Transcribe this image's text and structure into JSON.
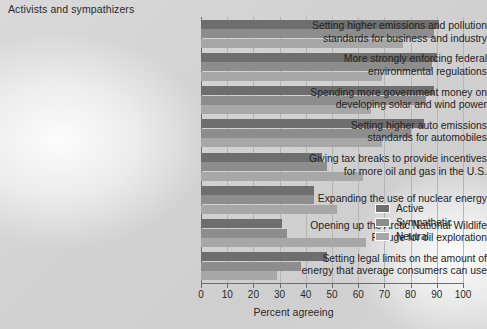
{
  "chart_title": "Activists and sympathizers",
  "xlabel": "Percent agreeing",
  "legend": {
    "items": [
      {
        "label": "Active",
        "color": "#6e6e6e"
      },
      {
        "label": "Sympathetic",
        "color": "#8d8d8d"
      },
      {
        "label": "Neutral",
        "color": "#a7a7a7"
      }
    ]
  },
  "axis": {
    "ticks": [
      "0",
      "10",
      "20",
      "30",
      "40",
      "50",
      "60",
      "70",
      "80",
      "90",
      "100"
    ]
  },
  "chart_data": {
    "type": "bar",
    "orientation": "horizontal",
    "title": "Activists and sympathizers",
    "xlabel": "Percent agreeing",
    "ylabel": "",
    "xlim": [
      0,
      100
    ],
    "xticks": [
      0,
      10,
      20,
      30,
      40,
      50,
      60,
      70,
      80,
      90,
      100
    ],
    "grid": true,
    "legend_position": "right-middle",
    "categories": [
      "Setting higher emissions and pollution standards for business and industry",
      "More strongly enforcing federal environmental regulations",
      "Spending more government money on developing solar and wind power",
      "Setting higher auto emissions standards for automobiles",
      "Giving tax breaks to provide incentives for more oil and gas in the U.S.",
      "Expanding the use of nuclear energy",
      "Opening up the Arctic National Wildlife Refuge for oil exploration",
      "Setting legal limits on the amount of energy that average consumers can use"
    ],
    "category_lines": [
      [
        "Setting higher emissions and pollution",
        "standards for business and industry"
      ],
      [
        "More strongly enforcing federal",
        "environmental regulations"
      ],
      [
        "Spending more government money on",
        "developing solar and wind power"
      ],
      [
        "Setting higher auto emissions",
        "standards for automobiles"
      ],
      [
        "Giving tax breaks to provide incentives",
        "for more oil and gas in the U.S."
      ],
      [
        "Expanding the use of nuclear energy"
      ],
      [
        "Opening up the Arctic National Wildlife",
        "Refuge for oil exploration"
      ],
      [
        "Setting legal limits on the amount of",
        "energy that average consumers can use"
      ]
    ],
    "series": [
      {
        "name": "Active",
        "color": "#6e6e6e",
        "values": [
          91,
          90,
          89,
          85,
          46,
          43,
          31,
          48
        ]
      },
      {
        "name": "Sympathetic",
        "color": "#8d8d8d",
        "values": [
          89,
          88,
          86,
          80,
          48,
          43,
          33,
          38
        ]
      },
      {
        "name": "Neutral",
        "color": "#a7a7a7",
        "values": [
          77,
          69,
          65,
          69,
          62,
          52,
          63,
          29
        ]
      }
    ]
  }
}
